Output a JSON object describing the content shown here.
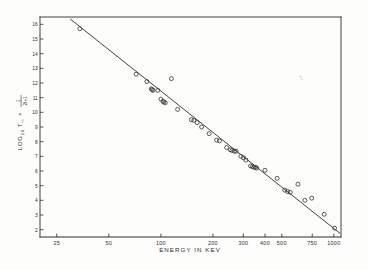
{
  "figure": {
    "background_color": "#fdfdfc",
    "ink_color": "#2e2c2b",
    "line_color": "#3a3837",
    "marker_color": "#353331"
  },
  "chart_data": {
    "type": "scatter",
    "title": "",
    "subtitle": "",
    "xlabel": "ENERGY IN KEV",
    "ylabel": "LOG10 T½ × 1/(2I+1)",
    "ylabel_parts": {
      "prefix": "LOG",
      "subscript": "10",
      "symbol": "T",
      "symbol_sub": "½",
      "times": "×",
      "fraction_numerator": "1",
      "fraction_denominator": "2I+1"
    },
    "xscale": "log",
    "yscale": "linear",
    "xlim": [
      20,
      1100
    ],
    "ylim": [
      1.5,
      16.5
    ],
    "grid": false,
    "legend": null,
    "xticks": [
      25,
      50,
      100,
      200,
      300,
      400,
      500,
      750,
      1000
    ],
    "xtick_labels": [
      "25",
      "50",
      "100",
      "200",
      "300",
      "400",
      "500",
      "750",
      "1000"
    ],
    "yticks": [
      2,
      3,
      4,
      5,
      6,
      7,
      8,
      9,
      10,
      11,
      12,
      13,
      14,
      15,
      16
    ],
    "ytick_labels": [
      "2",
      "3",
      "4",
      "5",
      "6",
      "7",
      "8",
      "9",
      "10",
      "11",
      "12",
      "13",
      "14",
      "15",
      "16"
    ],
    "marker_style": "open-circle",
    "points": [
      {
        "x": 34,
        "y": 15.7
      },
      {
        "x": 72,
        "y": 12.6
      },
      {
        "x": 83,
        "y": 12.1
      },
      {
        "x": 88,
        "y": 11.6
      },
      {
        "x": 89,
        "y": 11.55
      },
      {
        "x": 90,
        "y": 11.5
      },
      {
        "x": 96,
        "y": 11.5
      },
      {
        "x": 100,
        "y": 10.9
      },
      {
        "x": 103,
        "y": 10.75
      },
      {
        "x": 104,
        "y": 10.7
      },
      {
        "x": 106,
        "y": 10.65
      },
      {
        "x": 115,
        "y": 12.3
      },
      {
        "x": 125,
        "y": 10.2
      },
      {
        "x": 150,
        "y": 9.5
      },
      {
        "x": 155,
        "y": 9.45
      },
      {
        "x": 162,
        "y": 9.3
      },
      {
        "x": 172,
        "y": 9.0
      },
      {
        "x": 190,
        "y": 8.55
      },
      {
        "x": 210,
        "y": 8.1
      },
      {
        "x": 218,
        "y": 8.05
      },
      {
        "x": 240,
        "y": 7.6
      },
      {
        "x": 252,
        "y": 7.45
      },
      {
        "x": 258,
        "y": 7.4
      },
      {
        "x": 266,
        "y": 7.35
      },
      {
        "x": 272,
        "y": 7.35
      },
      {
        "x": 290,
        "y": 7.0
      },
      {
        "x": 300,
        "y": 6.9
      },
      {
        "x": 310,
        "y": 6.75
      },
      {
        "x": 330,
        "y": 6.35
      },
      {
        "x": 338,
        "y": 6.3
      },
      {
        "x": 345,
        "y": 6.25
      },
      {
        "x": 352,
        "y": 6.25
      },
      {
        "x": 358,
        "y": 6.2
      },
      {
        "x": 400,
        "y": 6.05
      },
      {
        "x": 470,
        "y": 5.5
      },
      {
        "x": 520,
        "y": 4.7
      },
      {
        "x": 540,
        "y": 4.6
      },
      {
        "x": 560,
        "y": 4.55
      },
      {
        "x": 620,
        "y": 5.1
      },
      {
        "x": 680,
        "y": 4.0
      },
      {
        "x": 745,
        "y": 4.15
      },
      {
        "x": 880,
        "y": 3.05
      },
      {
        "x": 1010,
        "y": 2.1
      }
    ],
    "fit_line": {
      "type": "line",
      "description": "straight line drawn through the data on log-x axis",
      "start": {
        "x": 30,
        "y": 16.35
      },
      "end": {
        "x": 1085,
        "y": 1.75
      }
    }
  }
}
